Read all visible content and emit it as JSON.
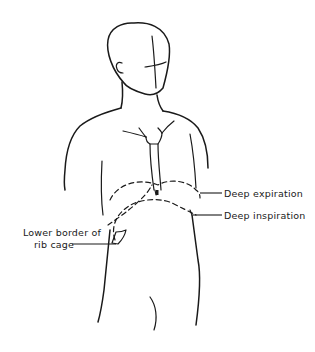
{
  "figure": {
    "labels": {
      "deep_expiration": "Deep expiration",
      "deep_inspiration": "Deep inspiration",
      "rib_cage_line1": "Lower border of",
      "rib_cage_line2": "rib cage"
    },
    "colors": {
      "line": "#1a1a1a",
      "background": "#ffffff"
    }
  }
}
